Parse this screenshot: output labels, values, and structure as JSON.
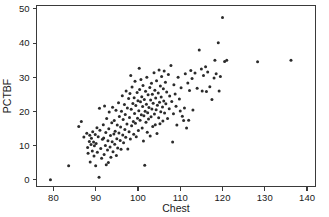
{
  "chart_data": {
    "type": "scatter",
    "title": "",
    "xlabel": "Chest",
    "ylabel": "PCTBF",
    "xlim": [
      76,
      142
    ],
    "ylim": [
      -2,
      51
    ],
    "xticks": [
      80,
      90,
      100,
      110,
      120,
      130,
      140
    ],
    "yticks": [
      0,
      10,
      20,
      30,
      40,
      50
    ],
    "grid": false,
    "legend": null,
    "marker": "circle",
    "marker_color": "#2b2b2b",
    "marker_size": 3,
    "n_points": 252,
    "points": [
      [
        79.3,
        0.0
      ],
      [
        83.6,
        4.1
      ],
      [
        86.0,
        15.6
      ],
      [
        86.6,
        17.0
      ],
      [
        87.2,
        12.5
      ],
      [
        87.9,
        13.6
      ],
      [
        88.1,
        9.4
      ],
      [
        88.2,
        7.7
      ],
      [
        88.5,
        11.2
      ],
      [
        88.6,
        13.0
      ],
      [
        88.7,
        5.2
      ],
      [
        88.9,
        10.3
      ],
      [
        89.0,
        12.1
      ],
      [
        89.2,
        8.4
      ],
      [
        89.3,
        14.0
      ],
      [
        89.5,
        11.0
      ],
      [
        89.6,
        6.9
      ],
      [
        89.7,
        9.9
      ],
      [
        89.9,
        13.2
      ],
      [
        90.0,
        4.1
      ],
      [
        90.1,
        10.6
      ],
      [
        90.3,
        15.2
      ],
      [
        90.4,
        8.0
      ],
      [
        90.6,
        12.6
      ],
      [
        90.8,
        0.7
      ],
      [
        90.9,
        20.9
      ],
      [
        91.0,
        14.5
      ],
      [
        91.2,
        9.1
      ],
      [
        91.4,
        6.3
      ],
      [
        91.6,
        11.8
      ],
      [
        91.8,
        16.1
      ],
      [
        91.9,
        12.2
      ],
      [
        92.0,
        7.4
      ],
      [
        92.1,
        21.6
      ],
      [
        92.3,
        10.0
      ],
      [
        92.4,
        13.8
      ],
      [
        92.5,
        4.4
      ],
      [
        92.6,
        17.9
      ],
      [
        92.8,
        8.7
      ],
      [
        92.9,
        11.4
      ],
      [
        93.0,
        5.0
      ],
      [
        93.1,
        14.9
      ],
      [
        93.2,
        19.8
      ],
      [
        93.4,
        9.6
      ],
      [
        93.5,
        12.9
      ],
      [
        93.6,
        6.6
      ],
      [
        93.8,
        16.7
      ],
      [
        93.9,
        11.1
      ],
      [
        94.0,
        21.2
      ],
      [
        94.1,
        8.2
      ],
      [
        94.3,
        13.4
      ],
      [
        94.4,
        17.3
      ],
      [
        94.5,
        10.4
      ],
      [
        94.6,
        14.2
      ],
      [
        94.8,
        20.3
      ],
      [
        94.9,
        7.1
      ],
      [
        95.0,
        12.0
      ],
      [
        95.1,
        16.0
      ],
      [
        95.2,
        9.3
      ],
      [
        95.4,
        22.5
      ],
      [
        95.5,
        13.7
      ],
      [
        95.6,
        18.5
      ],
      [
        95.8,
        11.5
      ],
      [
        95.9,
        15.4
      ],
      [
        96.0,
        8.9
      ],
      [
        96.1,
        20.0
      ],
      [
        96.3,
        24.6
      ],
      [
        96.4,
        13.1
      ],
      [
        96.5,
        17.6
      ],
      [
        96.6,
        10.8
      ],
      [
        96.8,
        22.0
      ],
      [
        96.9,
        14.7
      ],
      [
        97.0,
        19.1
      ],
      [
        97.1,
        12.4
      ],
      [
        97.2,
        26.0
      ],
      [
        97.4,
        16.3
      ],
      [
        97.5,
        21.0
      ],
      [
        97.6,
        9.0
      ],
      [
        97.8,
        23.8
      ],
      [
        97.9,
        14.0
      ],
      [
        98.0,
        18.2
      ],
      [
        98.1,
        25.2
      ],
      [
        98.2,
        11.9
      ],
      [
        98.3,
        30.5
      ],
      [
        98.4,
        20.6
      ],
      [
        98.5,
        15.8
      ],
      [
        98.6,
        27.1
      ],
      [
        98.8,
        22.3
      ],
      [
        98.9,
        17.0
      ],
      [
        99.0,
        13.3
      ],
      [
        99.1,
        24.0
      ],
      [
        99.2,
        19.4
      ],
      [
        99.3,
        28.8
      ],
      [
        99.4,
        16.5
      ],
      [
        99.5,
        21.7
      ],
      [
        99.6,
        12.6
      ],
      [
        99.8,
        25.5
      ],
      [
        99.9,
        18.0
      ],
      [
        100.0,
        23.1
      ],
      [
        100.1,
        14.4
      ],
      [
        100.2,
        20.2
      ],
      [
        100.3,
        32.6
      ],
      [
        100.4,
        26.4
      ],
      [
        100.5,
        17.4
      ],
      [
        100.6,
        22.8
      ],
      [
        100.7,
        29.3
      ],
      [
        100.8,
        19.0
      ],
      [
        100.9,
        24.3
      ],
      [
        101.0,
        15.1
      ],
      [
        101.1,
        21.4
      ],
      [
        101.2,
        27.6
      ],
      [
        101.3,
        11.3
      ],
      [
        101.4,
        18.7
      ],
      [
        101.5,
        23.5
      ],
      [
        101.6,
        4.2
      ],
      [
        101.7,
        20.0
      ],
      [
        101.8,
        25.9
      ],
      [
        101.9,
        16.8
      ],
      [
        102.0,
        22.1
      ],
      [
        102.1,
        30.0
      ],
      [
        102.2,
        13.9
      ],
      [
        102.3,
        19.6
      ],
      [
        102.4,
        24.9
      ],
      [
        102.5,
        17.8
      ],
      [
        102.6,
        21.1
      ],
      [
        102.8,
        27.0
      ],
      [
        102.9,
        12.8
      ],
      [
        103.0,
        23.3
      ],
      [
        103.1,
        18.4
      ],
      [
        103.2,
        28.2
      ],
      [
        103.3,
        20.7
      ],
      [
        103.4,
        25.0
      ],
      [
        103.5,
        15.6
      ],
      [
        103.6,
        22.4
      ],
      [
        103.8,
        31.3
      ],
      [
        103.9,
        19.2
      ],
      [
        104.0,
        26.2
      ],
      [
        104.1,
        16.1
      ],
      [
        104.2,
        23.9
      ],
      [
        104.3,
        20.5
      ],
      [
        104.4,
        29.0
      ],
      [
        104.5,
        13.5
      ],
      [
        104.6,
        21.8
      ],
      [
        104.8,
        25.4
      ],
      [
        104.9,
        18.1
      ],
      [
        105.0,
        32.1
      ],
      [
        105.1,
        22.7
      ],
      [
        105.2,
        16.4
      ],
      [
        105.3,
        27.4
      ],
      [
        105.4,
        19.9
      ],
      [
        105.5,
        24.2
      ],
      [
        105.6,
        30.2
      ],
      [
        105.8,
        21.3
      ],
      [
        105.9,
        17.2
      ],
      [
        106.0,
        26.6
      ],
      [
        106.1,
        23.0
      ],
      [
        106.2,
        31.8
      ],
      [
        106.3,
        19.5
      ],
      [
        106.5,
        28.5
      ],
      [
        106.6,
        22.2
      ],
      [
        106.8,
        25.7
      ],
      [
        107.0,
        17.9
      ],
      [
        107.2,
        30.8
      ],
      [
        107.4,
        20.8
      ],
      [
        107.5,
        24.5
      ],
      [
        107.8,
        33.4
      ],
      [
        108.0,
        22.9
      ],
      [
        108.2,
        11.0
      ],
      [
        108.4,
        19.3
      ],
      [
        108.5,
        27.8
      ],
      [
        108.8,
        25.1
      ],
      [
        109.0,
        21.5
      ],
      [
        109.2,
        16.0
      ],
      [
        109.5,
        30.0
      ],
      [
        109.8,
        23.6
      ],
      [
        110.0,
        20.1
      ],
      [
        110.2,
        26.9
      ],
      [
        110.5,
        18.6
      ],
      [
        110.8,
        17.3
      ],
      [
        111.0,
        21.0
      ],
      [
        111.2,
        31.0
      ],
      [
        111.5,
        15.1
      ],
      [
        111.8,
        28.3
      ],
      [
        112.0,
        17.4
      ],
      [
        112.2,
        26.1
      ],
      [
        112.5,
        32.0
      ],
      [
        112.8,
        29.6
      ],
      [
        113.0,
        20.4
      ],
      [
        113.5,
        31.2
      ],
      [
        114.0,
        26.8
      ],
      [
        114.5,
        38.0
      ],
      [
        115.0,
        32.4
      ],
      [
        115.2,
        26.0
      ],
      [
        115.5,
        30.5
      ],
      [
        116.0,
        33.1
      ],
      [
        116.2,
        25.8
      ],
      [
        116.5,
        31.5
      ],
      [
        117.0,
        27.2
      ],
      [
        117.5,
        23.5
      ],
      [
        118.0,
        29.8
      ],
      [
        118.2,
        35.0
      ],
      [
        118.5,
        31.0
      ],
      [
        119.0,
        40.1
      ],
      [
        119.2,
        26.0
      ],
      [
        119.5,
        30.2
      ],
      [
        120.0,
        47.5
      ],
      [
        120.5,
        34.6
      ],
      [
        121.0,
        35.0
      ],
      [
        128.3,
        34.5
      ],
      [
        136.2,
        35.0
      ]
    ]
  }
}
